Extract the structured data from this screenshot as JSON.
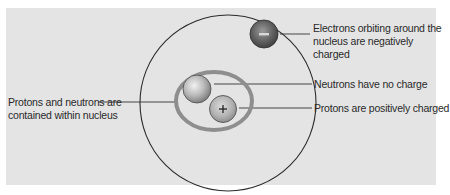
{
  "diagram": {
    "colors": {
      "background": "#e4e4e4",
      "orbit_line": "#2b2b2b",
      "nucleus_ring": "#8e8e8e",
      "electron": "#6b6b6b",
      "neutron": "#b5b5b5",
      "proton": "#b0b0b0",
      "leader_line": "#333333"
    },
    "particles": {
      "electron_symbol": "−",
      "proton_symbol": "+"
    },
    "labels": {
      "electron": {
        "line1": "Electrons orbiting around the",
        "line2": "nucleus are negatively charged"
      },
      "neutron": {
        "line1": "Neutrons have no charge"
      },
      "proton": {
        "line1": "Protons are positively charged"
      },
      "nucleus": {
        "line1": "Protons and neutrons are",
        "line2": "contained within nucleus"
      }
    }
  }
}
